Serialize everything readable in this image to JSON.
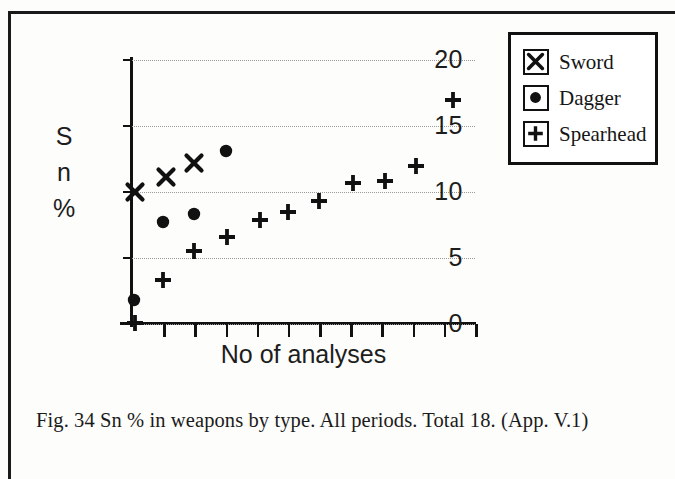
{
  "caption": "Fig. 34  Sn % in weapons  by  type. All periods. Total 18. (App. V.1)",
  "legend": {
    "items": [
      {
        "label": "Sword",
        "icon": "x-marker-icon",
        "key": "sword"
      },
      {
        "label": "Dagger",
        "icon": "circle-marker-icon",
        "key": "dagger"
      },
      {
        "label": "Spearhead",
        "icon": "plus-marker-icon",
        "key": "spearhead"
      }
    ]
  },
  "axes": {
    "y_title_lines": [
      "S",
      "n",
      "%"
    ],
    "x_title": "No of analyses",
    "y_ticks": [
      "0",
      "5",
      "10",
      "15",
      "20"
    ]
  },
  "chart_data": {
    "type": "scatter",
    "title": "Sn % in weapons by type. All periods. Total 18.",
    "xlabel": "No of analyses",
    "ylabel": "Sn %",
    "xlim": [
      0,
      11
    ],
    "ylim": [
      0,
      20
    ],
    "yticks": [
      0,
      5,
      10,
      15,
      20
    ],
    "xticks": [
      1,
      2,
      3,
      4,
      5,
      6,
      7,
      8,
      9,
      10,
      11
    ],
    "xtick_labels": [
      "",
      "",
      "",
      "",
      "",
      "",
      "",
      "",
      "",
      "",
      ""
    ],
    "grid": "horizontal-dotted",
    "legend_position": "outside-top-right",
    "series": [
      {
        "name": "Sword",
        "marker": "x",
        "points": [
          {
            "x": 0.1,
            "y": 10.0
          },
          {
            "x": 1.1,
            "y": 11.1
          },
          {
            "x": 2.0,
            "y": 12.2
          }
        ]
      },
      {
        "name": "Dagger",
        "marker": "filled-circle",
        "points": [
          {
            "x": 0.05,
            "y": 1.8
          },
          {
            "x": 1.0,
            "y": 7.7
          },
          {
            "x": 2.0,
            "y": 8.3
          },
          {
            "x": 3.0,
            "y": 13.1
          }
        ]
      },
      {
        "name": "Spearhead",
        "marker": "plus",
        "points": [
          {
            "x": 0.1,
            "y": 0.1
          },
          {
            "x": 1.0,
            "y": 3.3
          },
          {
            "x": 2.0,
            "y": 5.5
          },
          {
            "x": 3.05,
            "y": 6.6
          },
          {
            "x": 4.1,
            "y": 7.9
          },
          {
            "x": 5.0,
            "y": 8.5
          },
          {
            "x": 6.0,
            "y": 9.3
          },
          {
            "x": 7.1,
            "y": 10.7
          },
          {
            "x": 8.1,
            "y": 10.8
          },
          {
            "x": 9.1,
            "y": 12.0
          },
          {
            "x": 10.3,
            "y": 17.0
          }
        ]
      }
    ]
  }
}
